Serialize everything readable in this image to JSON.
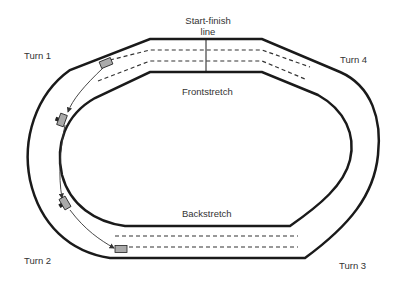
{
  "diagram": {
    "type": "oval race track",
    "labels": {
      "start_finish": "Start-finish",
      "start_finish_line2": "line",
      "frontstretch": "Frontstretch",
      "backstretch": "Backstretch",
      "turn1": "Turn 1",
      "turn2": "Turn 2",
      "turn3": "Turn 3",
      "turn4": "Turn 4"
    },
    "cars": [
      {
        "name": "car-turn1-entry",
        "color": "#aaaaaa"
      },
      {
        "name": "car-turn1-mid",
        "color": "#aaaaaa"
      },
      {
        "name": "car-turn2-mid",
        "color": "#aaaaaa"
      },
      {
        "name": "car-turn2-exit",
        "color": "#aaaaaa"
      }
    ],
    "colors": {
      "track_line": "#1a1a1a",
      "text": "#333333",
      "background": "#ffffff"
    }
  }
}
